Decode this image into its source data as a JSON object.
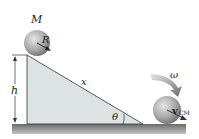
{
  "diagram": {
    "labels": {
      "mass": "M",
      "radius": "R",
      "height": "h",
      "incline_length": "x",
      "angle": "θ",
      "angular_velocity": "ω",
      "velocity": "v",
      "velocity_sub": "CM"
    },
    "colors": {
      "ramp_fill": "#d9dedf",
      "ground": "#8a8a8a",
      "sphere": "#a8a8a8",
      "arrow": "#555555"
    }
  }
}
